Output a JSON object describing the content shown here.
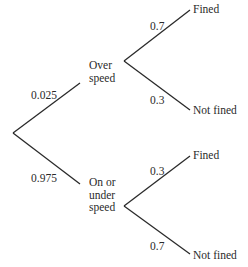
{
  "diagram": {
    "type": "probability-tree",
    "line_color": "#2a2a2a",
    "root": {
      "branches": [
        {
          "probability": "0.025",
          "node_label_lines": [
            "Over",
            "speed"
          ],
          "outcomes": [
            {
              "probability": "0.7",
              "label": "Fined"
            },
            {
              "probability": "0.3",
              "label": "Not fined"
            }
          ]
        },
        {
          "probability": "0.975",
          "node_label_lines": [
            "On or",
            "under",
            "speed"
          ],
          "outcomes": [
            {
              "probability": "0.3",
              "label": "Fined"
            },
            {
              "probability": "0.7",
              "label": "Not fined"
            }
          ]
        }
      ]
    }
  }
}
